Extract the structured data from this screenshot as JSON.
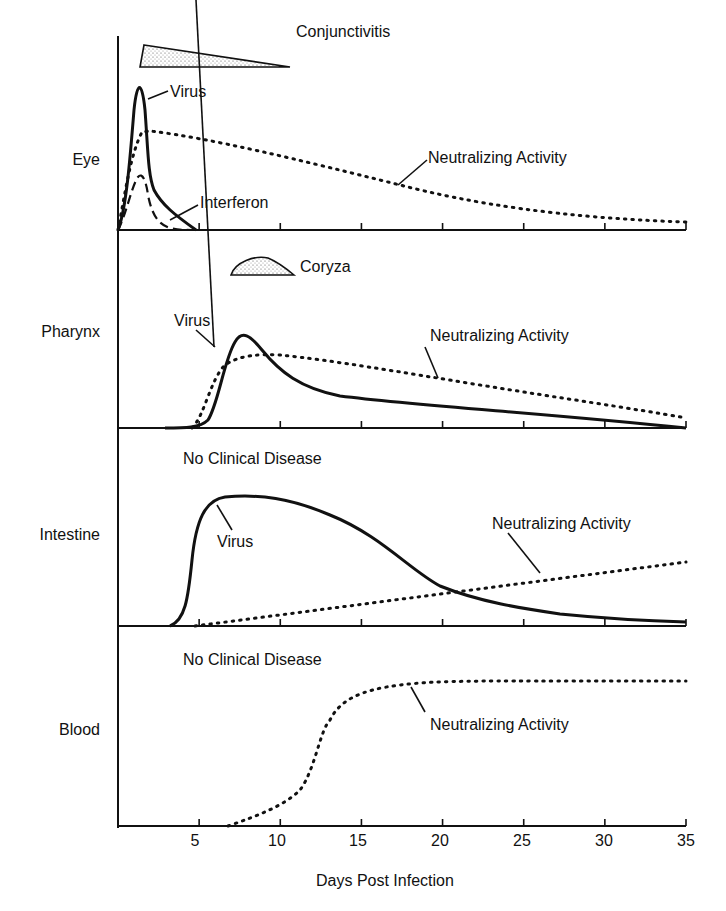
{
  "chart_data": {
    "type": "line",
    "title": "",
    "xlabel": "Days Post Infection",
    "ylabel": "",
    "xlim": [
      0,
      35
    ],
    "xticks": [
      5,
      10,
      15,
      20,
      25,
      30,
      35
    ],
    "grid": false,
    "panels": [
      {
        "name": "Eye",
        "clinical": "Conjunctivitis",
        "clinical_span_days": [
          1.5,
          10.5
        ],
        "series": [
          {
            "name": "Virus",
            "style": "solid",
            "x": [
              0,
              0.8,
              1.4,
              2.0,
              2.6,
              3.5,
              5
            ],
            "y": [
              0,
              40,
              95,
              40,
              15,
              6,
              0
            ]
          },
          {
            "name": "Interferon",
            "style": "dashed",
            "x": [
              0,
              0.8,
              1.5,
              2.2,
              3.0,
              4.0,
              4.5
            ],
            "y": [
              0,
              25,
              38,
              22,
              6,
              1,
              0
            ]
          },
          {
            "name": "Neutralizing Activity",
            "style": "dotted",
            "x": [
              0,
              1.0,
              2.0,
              5,
              10,
              15,
              20,
              25,
              30,
              35
            ],
            "y": [
              0,
              50,
              65,
              60,
              52,
              42,
              30,
              18,
              8,
              5
            ]
          }
        ]
      },
      {
        "name": "Pharynx",
        "clinical": "Coryza",
        "clinical_span_days": [
          7,
          10.5
        ],
        "series": [
          {
            "name": "Virus",
            "style": "solid",
            "x": [
              3,
              5,
              6.5,
              7.5,
              8.5,
              10,
              12,
              15,
              20,
              25,
              30,
              35
            ],
            "y": [
              0,
              1,
              20,
              55,
              55,
              45,
              30,
              20,
              16,
              12,
              8,
              2
            ]
          },
          {
            "name": "Neutralizing Activity",
            "style": "dotted",
            "x": [
              4,
              5.5,
              6.5,
              8,
              10,
              15,
              20,
              25,
              30,
              35
            ],
            "y": [
              0,
              3,
              25,
              40,
              44,
              40,
              33,
              26,
              18,
              10
            ]
          }
        ]
      },
      {
        "name": "Intestine",
        "clinical": "No Clinical Disease",
        "series": [
          {
            "name": "Virus",
            "style": "solid",
            "x": [
              3.5,
              5,
              6,
              8,
              10,
              13,
              17,
              20,
              23,
              26,
              30,
              35
            ],
            "y": [
              0,
              40,
              70,
              80,
              80,
              76,
              60,
              42,
              23,
              14,
              8,
              4
            ]
          },
          {
            "name": "Neutralizing Activity",
            "style": "dotted",
            "x": [
              5,
              10,
              15,
              20,
              25,
              30,
              35
            ],
            "y": [
              0,
              8,
              15,
              22,
              30,
              37,
              45
            ]
          }
        ]
      },
      {
        "name": "Blood",
        "clinical": "No Clinical Disease",
        "series": [
          {
            "name": "Neutralizing Activity",
            "style": "dotted",
            "x": [
              6.5,
              9,
              11,
              12.5,
              13.5,
              15,
              17,
              20,
              25,
              30,
              35
            ],
            "y": [
              0,
              6,
              18,
              40,
              60,
              73,
              80,
              83,
              84,
              84,
              84
            ]
          }
        ]
      }
    ]
  },
  "labels": {
    "panels": [
      "Eye",
      "Pharynx",
      "Intestine",
      "Blood"
    ],
    "eye_conjunctivitis": "Conjunctivitis",
    "eye_virus": "Virus",
    "eye_interferon": "Interferon",
    "eye_neutralizing": "Neutralizing Activity",
    "pharynx_coryza": "Coryza",
    "pharynx_virus": "Virus",
    "pharynx_neutralizing": "Neutralizing Activity",
    "intestine_clinical": "No Clinical Disease",
    "intestine_virus": "Virus",
    "intestine_neutralizing": "Neutralizing Activity",
    "blood_clinical": "No Clinical Disease",
    "blood_neutralizing": "Neutralizing Activity",
    "xticks": [
      "5",
      "10",
      "15",
      "20",
      "25",
      "30",
      "35"
    ],
    "xlabel": "Days Post Infection"
  }
}
